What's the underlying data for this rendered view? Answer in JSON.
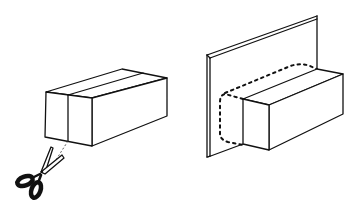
{
  "figure": {
    "colors": {
      "line": "#111111",
      "background": "#ffffff"
    }
  },
  "left_group": {
    "label": "box-with-cut-line",
    "box": {
      "front_face": "46,92 92,98 92,146 45,137",
      "top_face": "46,92 122,69 167,78 92,98",
      "side_face": "92,98 167,78 167,116 92,146",
      "band_front": "68,95 68,141",
      "band_top": "68,95 143,73"
    },
    "cut_line": "68,141 52,168",
    "scissors": {
      "icon": "scissors-icon",
      "pivot": [
        40,
        173
      ]
    }
  },
  "right_group": {
    "label": "panel-with-block",
    "panel": {
      "front": "207,55 317,16 317,70",
      "left_edge": "207,55 208,157",
      "bottom_edge": "208,157 243,144",
      "thickness_offset": 2
    },
    "block": {
      "front_face": "243,99 269,105 269,150 243,144",
      "top_face": "243,99 317,69 343,74 269,105",
      "side_face": "269,105 343,74 343,114 269,150"
    },
    "hidden_outline": "243,99 223,93 220,100 220,137 226,141 243,144 M223,93 C260,80 285,65 300,63 L317,69"
  }
}
